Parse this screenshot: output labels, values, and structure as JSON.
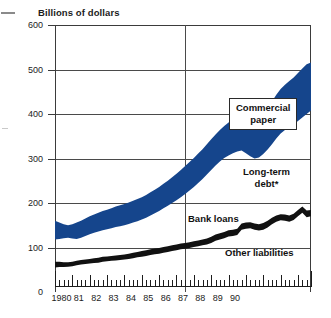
{
  "chart_data": {
    "type": "area",
    "title": "Billions of dollars",
    "xlabel": "",
    "ylabel": "Billions of dollars",
    "ylim": [
      0,
      600
    ],
    "yticks": [
      0,
      100,
      200,
      300,
      400,
      500,
      600
    ],
    "ytick_labels": [
      "0",
      "100",
      "200",
      "300",
      "400",
      "500",
      "600"
    ],
    "xlim": [
      1980,
      1990.75
    ],
    "xtick_labels": [
      "1980",
      "81",
      "82",
      "83",
      "84",
      "85",
      "86",
      "87",
      "88",
      "89",
      "90"
    ],
    "grid": true,
    "grid_vertical_at": [
      "1980",
      "1985.5",
      "1990.75"
    ],
    "legend_position": "inline-annotations",
    "footnote_marker": "*",
    "series": [
      {
        "name": "Other liabilities",
        "style": "area-below-black-band",
        "label_text": "Other liabilities",
        "label_boxed": false,
        "values": [
          55,
          56,
          56,
          57,
          58,
          60,
          62,
          63,
          64,
          65,
          66,
          68,
          69,
          70,
          71,
          72,
          73,
          74,
          76,
          78,
          79,
          81,
          83,
          85,
          86,
          88,
          90,
          92,
          94,
          96,
          97,
          99,
          101,
          103,
          105,
          107,
          110,
          115,
          118,
          121,
          125,
          126,
          128,
          140,
          142,
          143,
          140,
          138,
          140,
          145,
          152,
          158,
          161,
          160,
          158,
          162,
          170,
          178,
          168,
          170
        ]
      },
      {
        "name": "Bank loans",
        "style": "black-band",
        "label_text": "Bank loans",
        "label_boxed": false,
        "band_top_values": [
          68,
          68,
          67,
          67,
          68,
          70,
          72,
          73,
          74,
          76,
          77,
          79,
          80,
          81,
          82,
          83,
          84,
          86,
          88,
          90,
          92,
          94,
          96,
          98,
          99,
          101,
          103,
          105,
          107,
          109,
          110,
          112,
          114,
          116,
          118,
          120,
          124,
          129,
          132,
          135,
          139,
          140,
          142,
          154,
          156,
          157,
          154,
          152,
          155,
          160,
          167,
          172,
          175,
          174,
          172,
          176,
          184,
          192,
          183,
          184
        ]
      },
      {
        "name": "Long-term debt*",
        "style": "area-below-blue-band",
        "label_text": "Long-term debt*",
        "label_boxed": false,
        "values": [
          118,
          119,
          121,
          122,
          120,
          119,
          122,
          126,
          130,
          133,
          136,
          139,
          141,
          143,
          146,
          148,
          150,
          153,
          156,
          159,
          163,
          167,
          172,
          177,
          182,
          188,
          194,
          200,
          206,
          213,
          220,
          228,
          236,
          245,
          254,
          264,
          274,
          284,
          293,
          301,
          307,
          312,
          316,
          318,
          312,
          305,
          300,
          302,
          310,
          320,
          332,
          345,
          356,
          364,
          370,
          376,
          384,
          392,
          400,
          408
        ]
      },
      {
        "name": "Commercial paper",
        "style": "blue-band",
        "label_text": "Commercial paper",
        "label_boxed": true,
        "band_top_values": [
          160,
          156,
          152,
          150,
          152,
          156,
          160,
          165,
          170,
          174,
          178,
          182,
          185,
          188,
          192,
          195,
          198,
          201,
          205,
          209,
          213,
          218,
          224,
          230,
          236,
          243,
          250,
          258,
          266,
          274,
          283,
          292,
          301,
          311,
          321,
          332,
          343,
          354,
          364,
          373,
          381,
          388,
          394,
          398,
          394,
          390,
          388,
          392,
          402,
          414,
          428,
          443,
          456,
          466,
          474,
          482,
          492,
          502,
          512,
          516
        ]
      }
    ],
    "colors": {
      "commercial_paper": "#15458c",
      "long_term_debt": "#ffffff",
      "bank_loans": "#111111",
      "other_liabilities": "#ffffff",
      "grid": "#4a4a4a",
      "axis": "#1c1c1c",
      "text": "#1c1c1c",
      "background": "#ffffff"
    }
  },
  "labels": {
    "commercial_paper_line1": "Commercial",
    "commercial_paper_line2": "paper",
    "long_term_debt_line1": "Long-term",
    "long_term_debt_line2": "debt*",
    "bank_loans": "Bank loans",
    "other_liabilities": "Other liabilities"
  }
}
